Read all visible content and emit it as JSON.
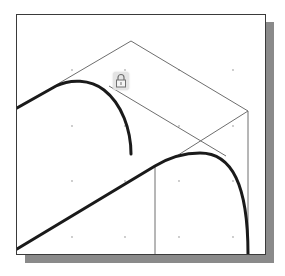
{
  "diagram": {
    "type": "cad-sketch-view",
    "colors": {
      "background": "#ffffff",
      "frame_border": "#3a3a3a",
      "shadow": "#8a8a8a",
      "thin_line": "#6e6e6e",
      "thick_curve": "#1a1a1a",
      "grid_dot": "#b8b8b8",
      "lock_badge": "#e4e4e4"
    },
    "grid": {
      "x": [
        72,
        125,
        179,
        233
      ],
      "y": [
        70,
        126,
        181,
        237
      ]
    },
    "construction_lines": [
      {
        "name": "apex-left-edge",
        "from": [
          131,
          41
        ],
        "to": [
          56,
          85
        ]
      },
      {
        "name": "apex-right-edge",
        "from": [
          131,
          41
        ],
        "to": [
          248,
          111
        ]
      },
      {
        "name": "right-vertical-edge",
        "from": [
          248,
          111
        ],
        "to": [
          248,
          254
        ]
      },
      {
        "name": "right-vertex-diagonal",
        "from": [
          248,
          111
        ],
        "to": [
          175,
          157
        ]
      },
      {
        "name": "short-diagonal",
        "from": [
          109,
          86
        ],
        "to": [
          226,
          156
        ]
      },
      {
        "name": "inner-vertical-edge",
        "from": [
          155,
          166
        ],
        "to": [
          155,
          254
        ]
      }
    ],
    "profile_curves": [
      {
        "name": "left-arc",
        "path": "M17 108 L56 86 C 70 79, 90 79, 104 90 C 122 104, 131 130, 131 154"
      },
      {
        "name": "long-line-with-right-arc",
        "path": "M17 249 L155 166 C 170 157, 185 153, 200 153 C 232 153, 248 185, 248 254"
      }
    ],
    "icons": [
      {
        "name": "lock-icon",
        "position": [
          120,
          80
        ]
      }
    ]
  }
}
